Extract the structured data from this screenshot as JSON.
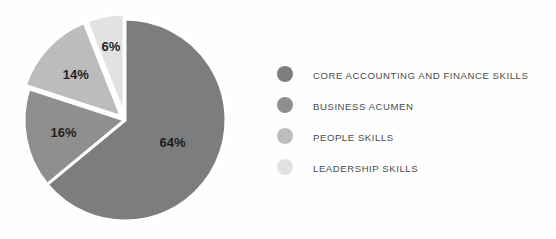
{
  "chart_data": {
    "type": "pie",
    "title": "",
    "subtitle": "",
    "xlabel": "",
    "ylabel": "",
    "legend_position": "right",
    "grid": false,
    "start_angle_deg": 0,
    "direction": "clockwise",
    "categories": [
      "CORE ACCOUNTING AND FINANCE SKILLS",
      "BUSINESS ACUMEN",
      "PEOPLE SKILLS",
      "LEADERSHIP SKILLS"
    ],
    "values": [
      64,
      16,
      14,
      6
    ],
    "value_labels": [
      "64%",
      "16%",
      "14%",
      "6%"
    ],
    "colors": [
      "#7d7d7d",
      "#8f8f8f",
      "#bcbcbc",
      "#e2e2e2"
    ],
    "slices": [
      {
        "label": "CORE ACCOUNTING AND FINANCE SKILLS",
        "value": 64,
        "value_label": "64%",
        "color": "#7d7d7d",
        "exploded": false
      },
      {
        "label": "BUSINESS ACUMEN",
        "value": 16,
        "value_label": "16%",
        "color": "#8f8f8f",
        "exploded": false
      },
      {
        "label": "PEOPLE SKILLS",
        "value": 14,
        "value_label": "14%",
        "color": "#bcbcbc",
        "exploded": true
      },
      {
        "label": "LEADERSHIP SKILLS",
        "value": 6,
        "value_label": "6%",
        "color": "#e2e2e2",
        "exploded": true
      }
    ]
  },
  "legend": {
    "items": [
      {
        "label": "CORE ACCOUNTING AND FINANCE SKILLS",
        "color": "#7d7d7d"
      },
      {
        "label": "BUSINESS ACUMEN",
        "color": "#8f8f8f"
      },
      {
        "label": "PEOPLE SKILLS",
        "color": "#bcbcbc"
      },
      {
        "label": "LEADERSHIP SKILLS",
        "color": "#e2e2e2"
      }
    ]
  },
  "style": {
    "background": "#fefefe",
    "separator_color": "#ffffff",
    "label_text_color": "#242424",
    "legend_text_color": "#4a4a4a"
  }
}
